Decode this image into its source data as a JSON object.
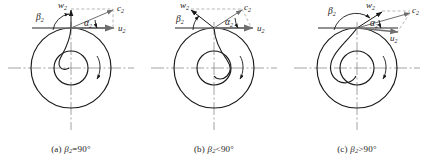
{
  "figure": {
    "type": "technical-diagram",
    "background_color": "#ffffff",
    "line_color": "#1a1a1a",
    "axis_color": "#707070",
    "dashed_color": "#8a8a8a"
  },
  "panels": [
    {
      "id": "a",
      "caption_prefix": "(a)",
      "caption_symbol": "β",
      "caption_sub": "2",
      "caption_relation": "=90°",
      "caption_full": "(a) β2=90°",
      "blade_type": "radial",
      "description": "Radial blade: relative velocity w2 is perpendicular to the tangential velocity u2.",
      "vectors": [
        {
          "name": "w2",
          "label": "w",
          "sub": "2",
          "direction": "vertical-up",
          "angle_deg": 90
        },
        {
          "name": "c2",
          "label": "c",
          "sub": "2",
          "direction": "up-right",
          "angle_deg": 22
        },
        {
          "name": "u2",
          "label": "u",
          "sub": "2",
          "direction": "horizontal-right",
          "angle_deg": 0
        }
      ],
      "angles": [
        {
          "name": "beta2",
          "label": "β",
          "sub": "2",
          "value_deg": 90
        },
        {
          "name": "alpha2",
          "label": "α",
          "sub": "2",
          "value_deg": 22
        }
      ]
    },
    {
      "id": "b",
      "caption_prefix": "(b)",
      "caption_symbol": "β",
      "caption_sub": "2",
      "caption_relation": "<90°",
      "caption_full": "(b) β2<90°",
      "blade_type": "backward-curved",
      "description": "Backward-curved blade: relative velocity w2 tilts back against the direction of rotation.",
      "vectors": [
        {
          "name": "w2",
          "label": "w",
          "sub": "2",
          "direction": "up-left",
          "angle_deg": 125
        },
        {
          "name": "c2",
          "label": "c",
          "sub": "2",
          "direction": "up-right",
          "angle_deg": 38
        },
        {
          "name": "u2",
          "label": "u",
          "sub": "2",
          "direction": "horizontal-right",
          "angle_deg": 0
        }
      ],
      "angles": [
        {
          "name": "beta2",
          "label": "β",
          "sub": "2",
          "value_deg": 55
        },
        {
          "name": "alpha2",
          "label": "α",
          "sub": "2",
          "value_deg": 38
        }
      ]
    },
    {
      "id": "c",
      "caption_prefix": "(c)",
      "caption_symbol": "β",
      "caption_sub": "2",
      "caption_relation": ">90°",
      "caption_full": "(c) β2>90°",
      "blade_type": "forward-curved",
      "description": "Forward-curved blade: relative velocity w2 leans forward in the direction of rotation.",
      "vectors": [
        {
          "name": "w2",
          "label": "w",
          "sub": "2",
          "direction": "up-right-shallow",
          "angle_deg": 32
        },
        {
          "name": "c2",
          "label": "c",
          "sub": "2",
          "direction": "up-right",
          "angle_deg": 16
        },
        {
          "name": "u2",
          "label": "u",
          "sub": "2",
          "direction": "right-down",
          "angle_deg": -12
        }
      ],
      "angles": [
        {
          "name": "beta2",
          "label": "β",
          "sub": "2",
          "value_deg": 148
        },
        {
          "name": "alpha2",
          "label": "α",
          "sub": "2",
          "value_deg": 16
        }
      ]
    }
  ],
  "impeller": {
    "outer_radius": 40,
    "inner_radius": 17,
    "center_x": 71,
    "center_y": 68,
    "rotation_marker": "curved-arrow-clockwise"
  }
}
